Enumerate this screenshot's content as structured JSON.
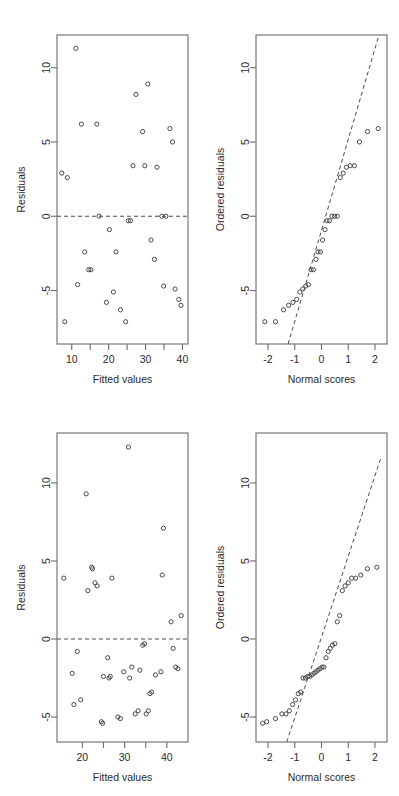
{
  "figure": {
    "width": 399,
    "height": 796,
    "background": "#ffffff",
    "point_color": "#4a4a4a",
    "axis_color": "#6b6b6b",
    "text_color": "#2b2b2b",
    "panel_count": 4,
    "layout": "2x2 grid of diagnostic plots"
  },
  "chart_data": [
    {
      "id": "panel-top-left",
      "type": "scatter",
      "title": "",
      "xlabel": "Fitted values",
      "ylabel": "Residuals",
      "xlim": [
        6.0,
        41.5
      ],
      "ylim": [
        -8.6,
        12.2
      ],
      "xticks": [
        10,
        15,
        20,
        25,
        30,
        35,
        40
      ],
      "xticklabels": [
        "10",
        "",
        "20",
        "",
        "30",
        "",
        "40"
      ],
      "yticks": [
        -5,
        0,
        5,
        10
      ],
      "yticklabels": [
        "-5",
        "0",
        "5",
        "10"
      ],
      "grid": false,
      "legend": "none",
      "annotations": [
        {
          "kind": "hline",
          "y": 0,
          "style": "dashed",
          "label": "zero residual reference line"
        }
      ],
      "x": [
        7.3,
        8.1,
        8.8,
        11.1,
        11.6,
        12.6,
        13.5,
        14.6,
        15.2,
        16.8,
        17.4,
        19.4,
        20.2,
        21.3,
        22.0,
        23.2,
        24.6,
        25.3,
        25.9,
        26.6,
        27.4,
        29.2,
        29.8,
        30.6,
        31.5,
        32.4,
        33.1,
        34.4,
        34.9,
        35.5,
        36.6,
        37.3,
        38.0,
        39.0,
        39.6
      ],
      "y": [
        2.9,
        -7.1,
        2.6,
        11.3,
        -4.6,
        6.2,
        -2.4,
        -3.6,
        -3.6,
        6.2,
        0.0,
        -5.8,
        -0.9,
        -5.1,
        -2.4,
        -6.3,
        -7.1,
        -0.3,
        -0.3,
        3.4,
        8.2,
        5.7,
        3.4,
        8.9,
        -1.6,
        -2.9,
        3.3,
        0.0,
        -4.7,
        0.0,
        5.9,
        5.0,
        -4.9,
        -5.6,
        -6.0
      ]
    },
    {
      "id": "panel-top-right",
      "type": "scatter",
      "title": "",
      "xlabel": "Normal scores",
      "ylabel": "Ordered residuals",
      "xlim": [
        -2.45,
        2.45
      ],
      "ylim": [
        -8.6,
        12.2
      ],
      "xticks": [
        -2,
        -1,
        0,
        1,
        2
      ],
      "xticklabels": [
        "-2",
        "-1",
        "0",
        "1",
        "2"
      ],
      "yticks": [
        -5,
        0,
        5,
        10
      ],
      "yticklabels": [
        "-5",
        "0",
        "5",
        "10"
      ],
      "grid": false,
      "legend": "none",
      "annotations": [
        {
          "kind": "qqline",
          "style": "dashed",
          "x1": -1.25,
          "y1": -8.6,
          "x2": 2.15,
          "y2": 12.2,
          "label": "normal reference line"
        }
      ],
      "x": [
        -2.12,
        -1.72,
        -1.42,
        -1.23,
        -1.07,
        -0.93,
        -0.81,
        -0.7,
        -0.59,
        -0.49,
        -0.39,
        -0.3,
        -0.21,
        -0.13,
        -0.04,
        0.04,
        0.13,
        0.21,
        0.3,
        0.39,
        0.49,
        0.59,
        0.7,
        0.81,
        0.93,
        1.07,
        1.23,
        1.42,
        1.72,
        2.12
      ],
      "y": [
        -7.1,
        -7.1,
        -6.3,
        -6.0,
        -5.8,
        -5.6,
        -5.1,
        -4.9,
        -4.7,
        -4.6,
        -3.6,
        -3.6,
        -2.9,
        -2.4,
        -2.4,
        -1.6,
        -0.9,
        -0.3,
        -0.3,
        0.0,
        0.0,
        0.0,
        2.6,
        2.9,
        3.3,
        3.4,
        3.4,
        5.0,
        5.7,
        5.9,
        6.2,
        6.2,
        8.2,
        8.9,
        11.3
      ]
    },
    {
      "id": "panel-bottom-left",
      "type": "scatter",
      "title": "",
      "xlabel": "Fitted values",
      "ylabel": "Residuals",
      "xlim": [
        14.0,
        45.0
      ],
      "ylim": [
        -6.6,
        13.2
      ],
      "xticks": [
        20,
        25,
        30,
        35,
        40
      ],
      "xticklabels": [
        "20",
        "",
        "30",
        "",
        "40"
      ],
      "yticks": [
        -5,
        0,
        5,
        10
      ],
      "yticklabels": [
        "-5",
        "0",
        "5",
        "10"
      ],
      "grid": false,
      "legend": "none",
      "annotations": [
        {
          "kind": "hline",
          "y": 0,
          "style": "dashed",
          "label": "zero residual reference line"
        }
      ],
      "x": [
        15.6,
        17.6,
        18.0,
        18.8,
        19.6,
        20.9,
        21.3,
        22.2,
        22.4,
        23.0,
        23.5,
        24.5,
        24.8,
        25.0,
        26.0,
        26.3,
        26.6,
        27.0,
        28.4,
        29.0,
        29.8,
        30.9,
        31.2,
        31.7,
        32.5,
        33.2,
        33.6,
        34.3,
        34.7,
        35.1,
        35.6,
        36.0,
        36.4,
        37.3,
        38.6,
        38.9,
        39.2,
        41.0,
        41.5,
        42.1,
        42.6,
        43.4
      ],
      "y": [
        3.9,
        -2.2,
        -4.2,
        -0.8,
        -3.9,
        9.3,
        3.1,
        4.6,
        4.5,
        3.6,
        3.4,
        -5.3,
        -5.4,
        -2.4,
        -1.2,
        -2.5,
        -2.4,
        3.9,
        -5.0,
        -5.1,
        -2.1,
        12.3,
        -2.5,
        -1.8,
        -4.8,
        -4.6,
        -2.0,
        -0.4,
        -0.3,
        -4.8,
        -4.6,
        -3.5,
        -3.4,
        -2.3,
        -2.1,
        4.1,
        7.1,
        1.1,
        -0.6,
        -1.8,
        -1.9,
        1.5
      ]
    },
    {
      "id": "panel-bottom-right",
      "type": "scatter",
      "title": "",
      "xlabel": "Normal scores",
      "ylabel": "Ordered residuals",
      "xlim": [
        -2.45,
        2.45
      ],
      "ylim": [
        -6.6,
        13.2
      ],
      "xticks": [
        -2,
        -1,
        0,
        1,
        2
      ],
      "xticklabels": [
        "-2",
        "-1",
        "0",
        "1",
        "2"
      ],
      "yticks": [
        -5,
        0,
        5,
        10
      ],
      "yticklabels": [
        "-5",
        "0",
        "5",
        "10"
      ],
      "grid": false,
      "legend": "none",
      "annotations": [
        {
          "kind": "qqline",
          "style": "dashed",
          "x1": -1.3,
          "y1": -6.6,
          "x2": 2.22,
          "y2": 11.6,
          "label": "normal reference line"
        }
      ],
      "x": [
        -2.2,
        -2.05,
        -1.72,
        -1.48,
        -1.33,
        -1.2,
        -1.08,
        -0.97,
        -0.87,
        -0.78,
        -0.69,
        -0.6,
        -0.52,
        -0.44,
        -0.36,
        -0.28,
        -0.21,
        -0.13,
        -0.06,
        0.02,
        0.09,
        0.17,
        0.25,
        0.33,
        0.41,
        0.5,
        0.59,
        0.68,
        0.78,
        0.88,
        1.0,
        1.13,
        1.28,
        1.47,
        1.72,
        2.07
      ],
      "y": [
        -5.4,
        -5.3,
        -5.1,
        -4.8,
        -4.8,
        -4.6,
        -4.2,
        -3.9,
        -3.5,
        -3.4,
        -2.5,
        -2.5,
        -2.4,
        -2.4,
        -2.3,
        -2.2,
        -2.1,
        -2.0,
        -1.9,
        -1.8,
        -1.8,
        -1.2,
        -0.8,
        -0.6,
        -0.4,
        -0.3,
        1.1,
        1.5,
        3.1,
        3.4,
        3.6,
        3.9,
        3.9,
        4.1,
        4.5,
        4.6,
        7.1,
        9.3,
        12.3
      ]
    }
  ],
  "panels": [
    {
      "key": "top_left",
      "xlabel": "Fitted values",
      "ylabel": "Residuals"
    },
    {
      "key": "top_right",
      "xlabel": "Normal scores",
      "ylabel": "Ordered residuals"
    },
    {
      "key": "bottom_left",
      "xlabel": "Fitted values",
      "ylabel": "Residuals"
    },
    {
      "key": "bottom_right",
      "xlabel": "Normal scores",
      "ylabel": "Ordered residuals"
    }
  ]
}
